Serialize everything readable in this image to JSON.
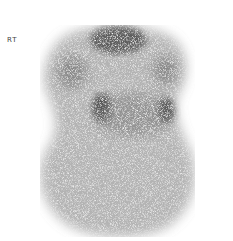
{
  "image": {
    "type": "nuclear-medicine-scintigraphy",
    "orientation_label": "RT",
    "background_color": "#ffffff",
    "tracer_color": "#2a2a2a"
  }
}
